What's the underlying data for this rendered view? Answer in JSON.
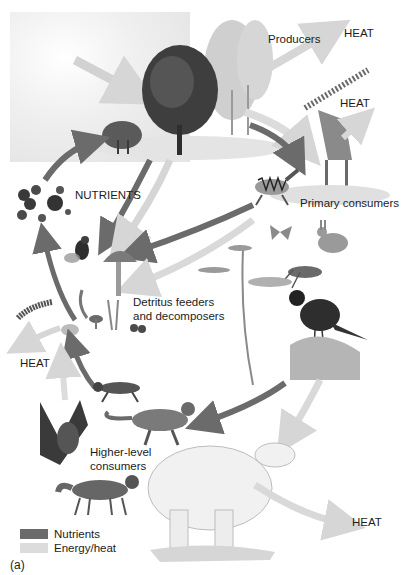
{
  "diagram": {
    "panel_label": "(a)",
    "colors": {
      "nutrients_arrow": "#6b6b6b",
      "energy_arrow": "#d9d9d9",
      "sun_glow": "#ececec"
    },
    "labels": {
      "producers": "Producers",
      "heat_producers": "HEAT",
      "heat_primary": "HEAT",
      "nutrients": "NUTRIENTS",
      "primary_consumers": "Primary consumers",
      "detritus_line1": "Detritus feeders",
      "detritus_line2": "and decomposers",
      "heat_detritus": "HEAT",
      "higher_line1": "Higher-level",
      "higher_line2": "consumers",
      "heat_higher": "HEAT"
    },
    "legend": [
      {
        "label": "Nutrients",
        "color": "#6b6b6b"
      },
      {
        "label": "Energy/heat",
        "color": "#dcdcdc"
      }
    ],
    "organisms": {
      "producers": [
        "tree",
        "shrub",
        "birch trees"
      ],
      "primary_consumers": [
        "zebra",
        "giraffe",
        "rabbit",
        "butterfly",
        "grasshopper",
        "bird"
      ],
      "detritus_feeders": [
        "fly",
        "mushroom",
        "millipede",
        "worm",
        "fungi"
      ],
      "higher_level_consumers": [
        "hyena",
        "cheetah",
        "owl",
        "fox",
        "polar bear"
      ]
    }
  }
}
